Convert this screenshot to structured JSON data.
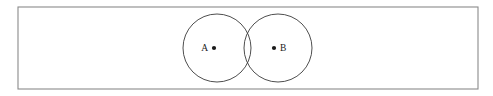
{
  "figure": {
    "type": "venn-diagram",
    "background_color": "#ffffff",
    "universe": {
      "shape": "rectangle",
      "x": 18,
      "y": 7,
      "width": 460,
      "height": 82,
      "stroke_color": "#8a8a8a",
      "fill_color": "#ffffff"
    },
    "sets": [
      {
        "label": "A",
        "shape": "circle",
        "cx": 217,
        "cy": 48,
        "r": 34,
        "stroke_color": "#3a3a3a",
        "label_x": 208,
        "label_y": 51,
        "label_anchor": "end",
        "dot": {
          "cx": 214,
          "cy": 48,
          "r": 2.1,
          "color": "#1a1a1a"
        }
      },
      {
        "label": "B",
        "shape": "circle",
        "cx": 278,
        "cy": 48,
        "r": 34,
        "stroke_color": "#3a3a3a",
        "label_x": 280,
        "label_y": 51,
        "label_anchor": "start",
        "dot": {
          "cx": 274,
          "cy": 48,
          "r": 2.1,
          "color": "#1a1a1a"
        }
      }
    ]
  }
}
